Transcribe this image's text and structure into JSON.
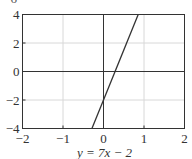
{
  "top_cut_text": "− 6",
  "chart_data": {
    "type": "line",
    "title": "",
    "caption": "y = 7x − 2",
    "xlabel": "",
    "ylabel": "",
    "xlim": [
      -2,
      2
    ],
    "ylim": [
      -4,
      4
    ],
    "xticks": [
      -2,
      -1,
      0,
      1,
      2
    ],
    "yticks": [
      -4,
      -2,
      0,
      2,
      4
    ],
    "xtick_labels": [
      "−2",
      "−1",
      "0",
      "1",
      "2"
    ],
    "ytick_labels": [
      "−4",
      "−2",
      "0",
      "2",
      "4"
    ],
    "grid": true,
    "legend": null,
    "series": [
      {
        "name": "y = 7x − 2",
        "slope": 7,
        "intercept": -2,
        "x": [
          -0.2857,
          0.8571
        ],
        "y": [
          -4,
          4
        ],
        "color": "#333333"
      }
    ],
    "colors": {
      "axis": "#333333",
      "grid": "#d8d8d8",
      "line": "#333333"
    }
  }
}
